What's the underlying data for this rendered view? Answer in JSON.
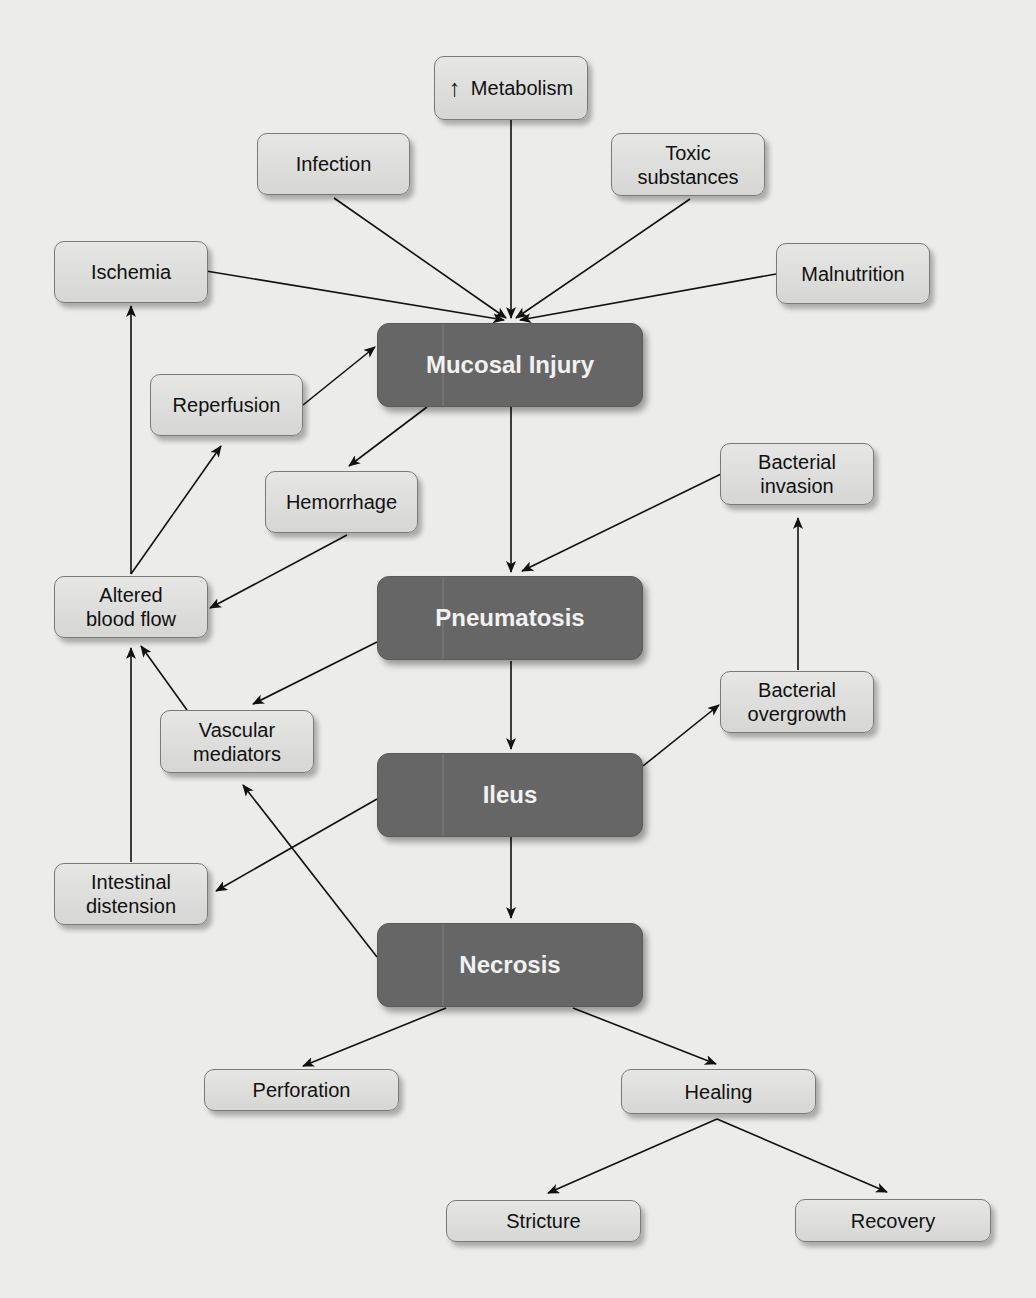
{
  "diagram": {
    "type": "flowchart",
    "colors": {
      "background": "#ececea",
      "light_node_fill": "#dededc",
      "dark_node_fill": "#666666",
      "edge": "#111111"
    },
    "nodes": {
      "metabolism": {
        "label": "Metabolism",
        "prefix_icon": "↑",
        "style": "light"
      },
      "infection": {
        "label": "Infection",
        "style": "light"
      },
      "toxic": {
        "line1": "Toxic",
        "line2": "substances",
        "style": "light"
      },
      "ischemia": {
        "label": "Ischemia",
        "style": "light"
      },
      "malnutrition": {
        "label": "Malnutrition",
        "style": "light"
      },
      "mucosal_injury": {
        "label": "Mucosal Injury",
        "style": "dark"
      },
      "reperfusion": {
        "label": "Reperfusion",
        "style": "light"
      },
      "hemorrhage": {
        "label": "Hemorrhage",
        "style": "light"
      },
      "bacterial_invasion": {
        "line1": "Bacterial",
        "line2": "invasion",
        "style": "light"
      },
      "altered_blood_flow": {
        "line1": "Altered",
        "line2": "blood flow",
        "style": "light"
      },
      "pneumatosis": {
        "label": "Pneumatosis",
        "style": "dark"
      },
      "bacterial_overgrowth": {
        "line1": "Bacterial",
        "line2": "overgrowth",
        "style": "light"
      },
      "vascular_mediators": {
        "line1": "Vascular",
        "line2": "mediators",
        "style": "light"
      },
      "ileus": {
        "label": "Ileus",
        "style": "dark"
      },
      "intestinal_distension": {
        "line1": "Intestinal",
        "line2": "distension",
        "style": "light"
      },
      "necrosis": {
        "label": "Necrosis",
        "style": "dark"
      },
      "perforation": {
        "label": "Perforation",
        "style": "light"
      },
      "healing": {
        "label": "Healing",
        "style": "light"
      },
      "stricture": {
        "label": "Stricture",
        "style": "light"
      },
      "recovery": {
        "label": "Recovery",
        "style": "light"
      }
    },
    "edges": [
      {
        "from": "metabolism",
        "to": "mucosal_injury"
      },
      {
        "from": "infection",
        "to": "mucosal_injury"
      },
      {
        "from": "toxic",
        "to": "mucosal_injury"
      },
      {
        "from": "ischemia",
        "to": "mucosal_injury"
      },
      {
        "from": "malnutrition",
        "to": "mucosal_injury"
      },
      {
        "from": "reperfusion",
        "to": "mucosal_injury"
      },
      {
        "from": "mucosal_injury",
        "to": "hemorrhage"
      },
      {
        "from": "mucosal_injury",
        "to": "pneumatosis"
      },
      {
        "from": "hemorrhage",
        "to": "altered_blood_flow"
      },
      {
        "from": "altered_blood_flow",
        "to": "reperfusion"
      },
      {
        "from": "altered_blood_flow",
        "to": "ischemia"
      },
      {
        "from": "bacterial_invasion",
        "to": "pneumatosis"
      },
      {
        "from": "pneumatosis",
        "to": "vascular_mediators"
      },
      {
        "from": "pneumatosis",
        "to": "ileus"
      },
      {
        "from": "vascular_mediators",
        "to": "altered_blood_flow"
      },
      {
        "from": "intestinal_distension",
        "to": "altered_blood_flow"
      },
      {
        "from": "ileus",
        "to": "bacterial_overgrowth"
      },
      {
        "from": "bacterial_overgrowth",
        "to": "bacterial_invasion"
      },
      {
        "from": "ileus",
        "to": "intestinal_distension"
      },
      {
        "from": "ileus",
        "to": "necrosis"
      },
      {
        "from": "necrosis",
        "to": "vascular_mediators"
      },
      {
        "from": "necrosis",
        "to": "perforation"
      },
      {
        "from": "necrosis",
        "to": "healing"
      },
      {
        "from": "healing",
        "to": "stricture"
      },
      {
        "from": "healing",
        "to": "recovery"
      }
    ]
  }
}
